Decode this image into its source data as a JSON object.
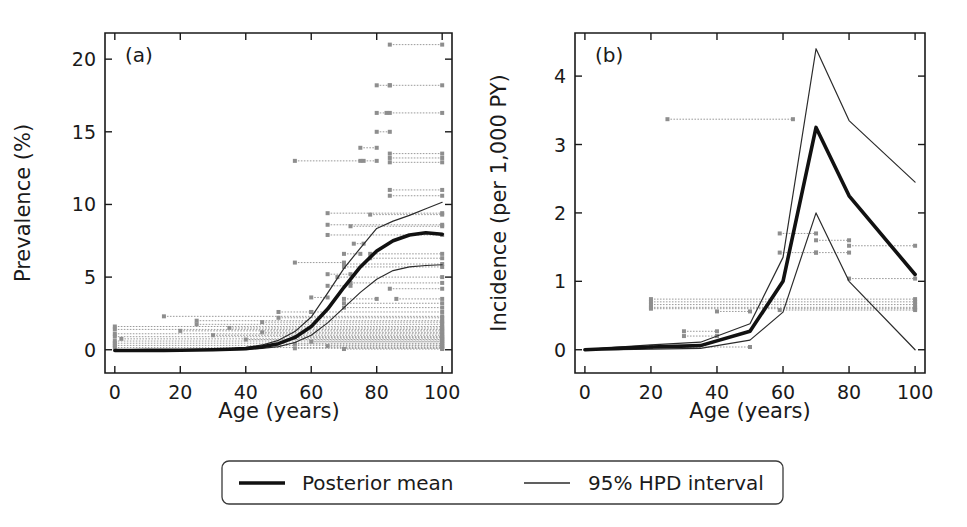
{
  "figure": {
    "background_color": "#ffffff",
    "mean_color": "#111111",
    "hpd_color": "#2b2b2b",
    "data_color": "#9a9a9a"
  },
  "legend": {
    "mean_label": "Posterior mean",
    "hpd_label": "95% HPD interval"
  },
  "chart_data": [
    {
      "type": "line",
      "panel_tag": "(a)",
      "title": "",
      "xlabel": "Age (years)",
      "ylabel": "Prevalence (%)",
      "xlim": [
        -3,
        103
      ],
      "ylim": [
        -1.6,
        21.8
      ],
      "xticks": [
        0,
        20,
        40,
        60,
        80,
        100
      ],
      "yticks": [
        0,
        5,
        10,
        15,
        20
      ],
      "grid": false,
      "legend_position": "below-figure",
      "x": [
        0,
        5,
        10,
        15,
        20,
        25,
        30,
        35,
        40,
        45,
        50,
        55,
        60,
        65,
        70,
        75,
        80,
        85,
        90,
        95,
        100
      ],
      "series": [
        {
          "name": "Posterior mean",
          "style": "thick",
          "values": [
            -0.05,
            -0.05,
            -0.04,
            -0.04,
            -0.03,
            -0.02,
            0.0,
            0.03,
            0.08,
            0.2,
            0.42,
            0.85,
            1.6,
            2.8,
            4.3,
            5.7,
            6.8,
            7.5,
            7.9,
            8.05,
            7.95
          ]
        },
        {
          "name": "95% HPD upper",
          "style": "thin",
          "values": [
            -0.04,
            -0.04,
            -0.03,
            -0.03,
            -0.02,
            0.0,
            0.03,
            0.07,
            0.15,
            0.33,
            0.65,
            1.25,
            2.25,
            3.9,
            5.6,
            7.0,
            8.35,
            8.85,
            9.25,
            9.7,
            10.15
          ]
        },
        {
          "name": "95% HPD lower",
          "style": "thin",
          "values": [
            -0.06,
            -0.06,
            -0.05,
            -0.05,
            -0.04,
            -0.03,
            -0.02,
            0.0,
            0.03,
            0.1,
            0.22,
            0.5,
            1.0,
            1.85,
            2.9,
            3.95,
            4.85,
            5.45,
            5.7,
            5.8,
            5.85
          ]
        }
      ],
      "data_bars": [
        {
          "x0": 84,
          "x1": 100,
          "y": 21.0
        },
        {
          "x0": 80,
          "x1": 84,
          "y": 18.2
        },
        {
          "x0": 84,
          "x1": 100,
          "y": 18.2
        },
        {
          "x0": 80,
          "x1": 83,
          "y": 16.3
        },
        {
          "x0": 84,
          "x1": 100,
          "y": 16.3
        },
        {
          "x0": 80,
          "x1": 84,
          "y": 15.0
        },
        {
          "x0": 75,
          "x1": 80,
          "y": 13.9
        },
        {
          "x0": 55,
          "x1": 75,
          "y": 13.0
        },
        {
          "x0": 76,
          "x1": 80,
          "y": 13.0
        },
        {
          "x0": 84,
          "x1": 100,
          "y": 13.5
        },
        {
          "x0": 84,
          "x1": 100,
          "y": 13.2
        },
        {
          "x0": 84,
          "x1": 100,
          "y": 12.9
        },
        {
          "x0": 84,
          "x1": 100,
          "y": 11.0
        },
        {
          "x0": 84,
          "x1": 100,
          "y": 10.6
        },
        {
          "x0": 65,
          "x1": 100,
          "y": 9.4
        },
        {
          "x0": 78,
          "x1": 100,
          "y": 9.3
        },
        {
          "x0": 65,
          "x1": 100,
          "y": 8.6
        },
        {
          "x0": 72,
          "x1": 100,
          "y": 8.5
        },
        {
          "x0": 65,
          "x1": 100,
          "y": 7.9
        },
        {
          "x0": 73,
          "x1": 76,
          "y": 7.3
        },
        {
          "x0": 70,
          "x1": 75,
          "y": 6.6
        },
        {
          "x0": 78,
          "x1": 100,
          "y": 6.6
        },
        {
          "x0": 78,
          "x1": 100,
          "y": 6.3
        },
        {
          "x0": 55,
          "x1": 70,
          "y": 6.0
        },
        {
          "x0": 70,
          "x1": 100,
          "y": 5.9
        },
        {
          "x0": 70,
          "x1": 100,
          "y": 5.7
        },
        {
          "x0": 65,
          "x1": 72,
          "y": 5.2
        },
        {
          "x0": 68,
          "x1": 100,
          "y": 5.0
        },
        {
          "x0": 72,
          "x1": 100,
          "y": 4.6
        },
        {
          "x0": 65,
          "x1": 72,
          "y": 4.4
        },
        {
          "x0": 84,
          "x1": 100,
          "y": 4.2
        },
        {
          "x0": 60,
          "x1": 65,
          "y": 3.6
        },
        {
          "x0": 70,
          "x1": 80,
          "y": 3.5
        },
        {
          "x0": 86,
          "x1": 100,
          "y": 3.5
        },
        {
          "x0": 70,
          "x1": 100,
          "y": 3.2
        },
        {
          "x0": 70,
          "x1": 100,
          "y": 2.9
        },
        {
          "x0": 50,
          "x1": 60,
          "y": 2.6
        },
        {
          "x0": 60,
          "x1": 100,
          "y": 2.6
        },
        {
          "x0": 15,
          "x1": 100,
          "y": 2.3
        },
        {
          "x0": 50,
          "x1": 100,
          "y": 2.2
        },
        {
          "x0": 25,
          "x1": 100,
          "y": 2.0
        },
        {
          "x0": 45,
          "x1": 100,
          "y": 1.9
        },
        {
          "x0": 25,
          "x1": 100,
          "y": 1.75
        },
        {
          "x0": 0,
          "x1": 100,
          "y": 1.6
        },
        {
          "x0": 35,
          "x1": 100,
          "y": 1.5
        },
        {
          "x0": 0,
          "x1": 100,
          "y": 1.4
        },
        {
          "x0": 20,
          "x1": 100,
          "y": 1.3
        },
        {
          "x0": 45,
          "x1": 100,
          "y": 1.2
        },
        {
          "x0": 0,
          "x1": 100,
          "y": 1.1
        },
        {
          "x0": 30,
          "x1": 100,
          "y": 1.0
        },
        {
          "x0": 0,
          "x1": 100,
          "y": 0.9
        },
        {
          "x0": 55,
          "x1": 100,
          "y": 0.85
        },
        {
          "x0": 2,
          "x1": 100,
          "y": 0.75
        },
        {
          "x0": 40,
          "x1": 100,
          "y": 0.7
        },
        {
          "x0": 0,
          "x1": 100,
          "y": 0.6
        },
        {
          "x0": 60,
          "x1": 100,
          "y": 0.55
        },
        {
          "x0": 0,
          "x1": 100,
          "y": 0.45
        },
        {
          "x0": 55,
          "x1": 100,
          "y": 0.4
        },
        {
          "x0": 0,
          "x1": 100,
          "y": 0.3
        },
        {
          "x0": 65,
          "x1": 100,
          "y": 0.25
        },
        {
          "x0": 0,
          "x1": 100,
          "y": 0.15
        },
        {
          "x0": 55,
          "x1": 100,
          "y": 0.1
        },
        {
          "x0": 70,
          "x1": 100,
          "y": 0.05
        }
      ]
    },
    {
      "type": "line",
      "panel_tag": "(b)",
      "title": "",
      "xlabel": "Age (years)",
      "ylabel": "Incidence (per 1,000 PY)",
      "xlim": [
        -3,
        103
      ],
      "ylim": [
        -0.34,
        4.63
      ],
      "xticks": [
        0,
        20,
        40,
        60,
        80,
        100
      ],
      "yticks": [
        0,
        1,
        2,
        3,
        4
      ],
      "grid": false,
      "legend_position": "below-figure",
      "x": [
        0,
        5,
        10,
        20,
        35,
        50,
        60,
        70,
        80,
        100
      ],
      "series": [
        {
          "name": "Posterior mean",
          "style": "thick",
          "values": [
            0.0,
            0.01,
            0.02,
            0.04,
            0.06,
            0.27,
            1.0,
            3.25,
            2.25,
            1.1
          ]
        },
        {
          "name": "95% HPD upper",
          "style": "thin",
          "values": [
            0.0,
            0.02,
            0.04,
            0.07,
            0.11,
            0.38,
            1.35,
            4.4,
            3.35,
            2.45
          ]
        },
        {
          "name": "95% HPD lower",
          "style": "thin",
          "values": [
            0.0,
            0.0,
            0.0,
            0.01,
            0.02,
            0.14,
            0.55,
            2.0,
            1.0,
            0.0
          ]
        }
      ],
      "data_bars": [
        {
          "x0": 25,
          "x1": 63,
          "y": 3.37
        },
        {
          "x0": 59,
          "x1": 70,
          "y": 1.7
        },
        {
          "x0": 70,
          "x1": 80,
          "y": 1.6
        },
        {
          "x0": 80,
          "x1": 100,
          "y": 1.52
        },
        {
          "x0": 59,
          "x1": 70,
          "y": 1.42
        },
        {
          "x0": 70,
          "x1": 80,
          "y": 1.42
        },
        {
          "x0": 80,
          "x1": 100,
          "y": 1.04
        },
        {
          "x0": 20,
          "x1": 100,
          "y": 0.74
        },
        {
          "x0": 20,
          "x1": 100,
          "y": 0.7
        },
        {
          "x0": 20,
          "x1": 100,
          "y": 0.66
        },
        {
          "x0": 20,
          "x1": 100,
          "y": 0.62
        },
        {
          "x0": 20,
          "x1": 100,
          "y": 0.6
        },
        {
          "x0": 40,
          "x1": 50,
          "y": 0.56
        },
        {
          "x0": 59,
          "x1": 100,
          "y": 0.58
        },
        {
          "x0": 30,
          "x1": 40,
          "y": 0.27
        },
        {
          "x0": 30,
          "x1": 40,
          "y": 0.2
        },
        {
          "x0": 20,
          "x1": 50,
          "y": 0.04
        }
      ]
    }
  ]
}
